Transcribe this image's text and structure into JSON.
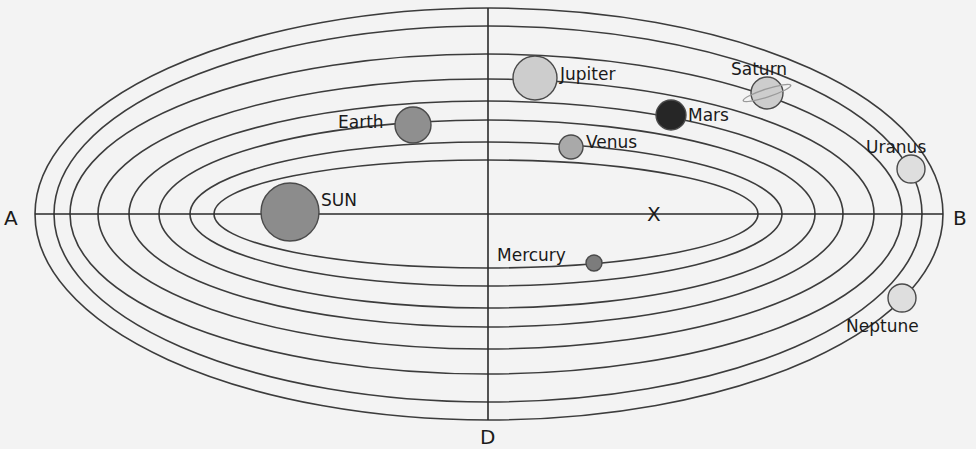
{
  "axis_labels": {
    "left": "A",
    "right": "B",
    "bottom": "D",
    "center_marker": "X"
  },
  "orbits": [
    {
      "cx": 489,
      "cy": 214,
      "rx": 454,
      "ry": 206
    },
    {
      "cx": 488,
      "cy": 214,
      "rx": 434,
      "ry": 188
    },
    {
      "cx": 486,
      "cy": 214,
      "rx": 416,
      "ry": 160
    },
    {
      "cx": 486,
      "cy": 214,
      "rx": 388,
      "ry": 135
    },
    {
      "cx": 486,
      "cy": 214,
      "rx": 357,
      "ry": 113
    },
    {
      "cx": 487,
      "cy": 214,
      "rx": 328,
      "ry": 94
    },
    {
      "cx": 486,
      "cy": 214,
      "rx": 296,
      "ry": 72
    },
    {
      "cx": 486,
      "cy": 214,
      "rx": 272,
      "ry": 54
    }
  ],
  "bodies": [
    {
      "id": "sun",
      "label": "SUN",
      "cx": 290,
      "cy": 212,
      "r": 29,
      "fill": "#8c8c8c",
      "lx": 321,
      "ly": 206
    },
    {
      "id": "mercury",
      "label": "Mercury",
      "cx": 594,
      "cy": 263,
      "r": 8,
      "fill": "#7c7c7c",
      "lx": 497,
      "ly": 261
    },
    {
      "id": "venus",
      "label": "Venus",
      "cx": 571,
      "cy": 147,
      "r": 12,
      "fill": "#a9a9a9",
      "lx": 586,
      "ly": 148
    },
    {
      "id": "earth",
      "label": "Earth",
      "cx": 413,
      "cy": 125,
      "r": 18,
      "fill": "#8f8f8f",
      "lx": 338,
      "ly": 128
    },
    {
      "id": "mars",
      "label": "Mars",
      "cx": 671,
      "cy": 115,
      "r": 15,
      "fill": "#262626",
      "lx": 688,
      "ly": 121
    },
    {
      "id": "jupiter",
      "label": "Jupiter",
      "cx": 535,
      "cy": 78,
      "r": 22,
      "fill": "#cdcdcd",
      "lx": 560,
      "ly": 80
    },
    {
      "id": "saturn",
      "label": "Saturn",
      "cx": 767,
      "cy": 93,
      "r": 16,
      "fill": "#cdcdcd",
      "lx": 731,
      "ly": 75,
      "ring": true
    },
    {
      "id": "uranus",
      "label": "Uranus",
      "cx": 911,
      "cy": 169,
      "r": 14,
      "fill": "#dedede",
      "lx": 866,
      "ly": 153
    },
    {
      "id": "neptune",
      "label": "Neptune",
      "cx": 902,
      "cy": 298,
      "r": 14,
      "fill": "#dedede",
      "lx": 846,
      "ly": 332
    }
  ]
}
